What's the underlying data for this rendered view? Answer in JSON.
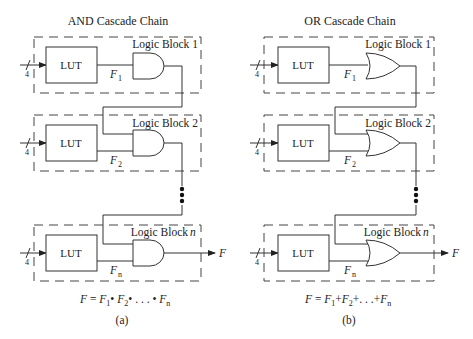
{
  "panels": [
    {
      "id": "a",
      "title": "AND Cascade Chain",
      "gate_type": "AND",
      "caption": "(a)",
      "equation": {
        "lhs": "F",
        "eq": " = ",
        "terms": [
          "F",
          "F",
          "F"
        ],
        "subs": [
          "1",
          "2",
          "n"
        ],
        "op": "•",
        "ellipsis": ". . ."
      },
      "blocks": [
        {
          "label": "Logic Block 1",
          "lut": "LUT",
          "bus_width": "4",
          "signal": "F",
          "signal_sub": "1"
        },
        {
          "label": "Logic Block 2",
          "lut": "LUT",
          "bus_width": "4",
          "signal": "F",
          "signal_sub": "2"
        },
        {
          "label": "Logic Block ",
          "label_var": "n",
          "lut": "LUT",
          "bus_width": "4",
          "signal": "F",
          "signal_sub": "n"
        }
      ],
      "output": "F"
    },
    {
      "id": "b",
      "title": "OR Cascade Chain",
      "gate_type": "OR",
      "caption": "(b)",
      "equation": {
        "lhs": "F",
        "eq": " = ",
        "terms": [
          "F",
          "F",
          "F"
        ],
        "subs": [
          "1",
          "2",
          "n"
        ],
        "op": "+",
        "ellipsis": ". . ."
      },
      "blocks": [
        {
          "label": "Logic Block 1",
          "lut": "LUT",
          "bus_width": "4",
          "signal": "F",
          "signal_sub": "1"
        },
        {
          "label": "Logic Block 2",
          "lut": "LUT",
          "bus_width": "4",
          "signal": "F",
          "signal_sub": "2"
        },
        {
          "label": "Logic Block ",
          "label_var": "n",
          "lut": "LUT",
          "bus_width": "4",
          "signal": "F",
          "signal_sub": "n"
        }
      ],
      "output": "F"
    }
  ]
}
